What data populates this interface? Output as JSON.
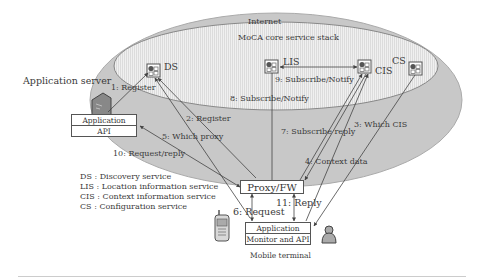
{
  "diagram": {
    "regions": {
      "internet": "Internet",
      "core": "MoCA core service stack"
    },
    "nodes": {
      "ds": "DS",
      "lis": "LIS",
      "cis": "CIS",
      "cs": "CS",
      "app_server_title": "Application server",
      "app_server_box": "Application server",
      "app_server_api": "API",
      "proxy": "Proxy/FW",
      "app_client": "Application client",
      "monitor_api": "Monitor and API",
      "mobile_terminal": "Mobile terminal"
    },
    "edges": [
      {
        "id": "e1",
        "label": "1: Register"
      },
      {
        "id": "e2",
        "label": "2: Register"
      },
      {
        "id": "e3",
        "label": "3: Which CIS"
      },
      {
        "id": "e4",
        "label": "4: Context data"
      },
      {
        "id": "e5",
        "label": "5: Which proxy"
      },
      {
        "id": "e6",
        "label": "6: Request"
      },
      {
        "id": "e7",
        "label": "7: Subscribe reply"
      },
      {
        "id": "e8",
        "label": "8: Subscribe/Notify"
      },
      {
        "id": "e9",
        "label": "9: Subscribe/Notify"
      },
      {
        "id": "e10",
        "label": "10: Request/reply"
      },
      {
        "id": "e11",
        "label": "11: Reply"
      }
    ],
    "legend": [
      "DS  : Discovery service",
      "LIS : Location information service",
      "CIS : Context information service",
      "CS  : Configuration service"
    ],
    "colors": {
      "outer_fill": "#c8c8c8",
      "inner_fill": "#ececec",
      "stroke": "#555555"
    }
  }
}
